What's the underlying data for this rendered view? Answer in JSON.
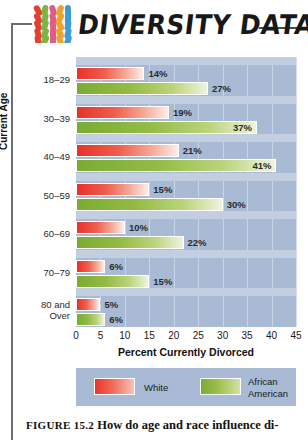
{
  "header": {
    "title": "DIVERSITY DATA",
    "logo_icon": "diversity-people-grid-icon"
  },
  "chart_data": {
    "type": "bar",
    "orientation": "horizontal",
    "title": "",
    "categories": [
      "18–29",
      "30–39",
      "40–49",
      "50–59",
      "60–69",
      "70–79",
      "80 and Over"
    ],
    "series": [
      {
        "name": "White",
        "color": "#ea352d",
        "values": [
          14,
          19,
          21,
          15,
          10,
          6,
          5
        ],
        "labels": [
          "14%",
          "19%",
          "21%",
          "15%",
          "10%",
          "6%",
          "5%"
        ]
      },
      {
        "name": "African American",
        "color": "#7cab34",
        "values": [
          27,
          37,
          41,
          30,
          22,
          15,
          6
        ],
        "labels": [
          "27%",
          "37%",
          "41%",
          "30%",
          "22%",
          "15%",
          "6%"
        ]
      }
    ],
    "xlabel": "Percent Currently Divorced",
    "ylabel": "Current Age",
    "xlim": [
      0,
      45
    ],
    "xticks": [
      "0",
      "5",
      "10",
      "15",
      "20",
      "25",
      "30",
      "35",
      "40",
      "45"
    ],
    "grid": true,
    "legend_position": "bottom",
    "plot_background": "#a8bad4"
  },
  "legend": {
    "items": [
      {
        "label": "White",
        "swatch": "white-swatch"
      },
      {
        "label_line1": "African",
        "label_line2": "American",
        "swatch": "african-american-swatch"
      }
    ]
  },
  "caption": {
    "figure_number": "FIGURE 15.2",
    "text": "How do age and race influence di-"
  }
}
